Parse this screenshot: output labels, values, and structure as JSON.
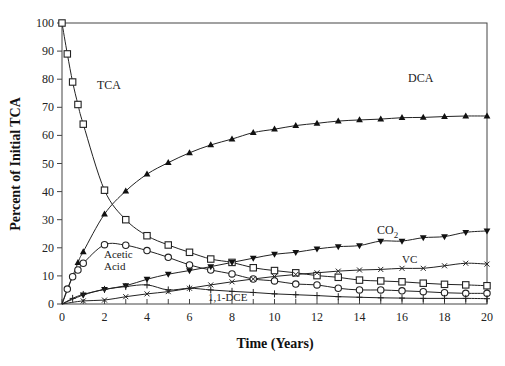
{
  "chart_data": {
    "type": "line",
    "title": "",
    "xlabel": "Time (Years)",
    "ylabel": "Percent of Initial TCA",
    "xlim": [
      0,
      20
    ],
    "ylim": [
      0,
      100
    ],
    "xticks": [
      0,
      2,
      4,
      6,
      8,
      10,
      12,
      14,
      16,
      18,
      20
    ],
    "yticks": [
      0,
      10,
      20,
      30,
      40,
      50,
      60,
      70,
      80,
      90,
      100
    ],
    "grid": false,
    "legend": "inline labels",
    "series": [
      {
        "name": "TCA",
        "marker": "open-square",
        "x": [
          0,
          0.25,
          0.5,
          0.75,
          1,
          2,
          3,
          4,
          5,
          6,
          7,
          8,
          9,
          10,
          11,
          12,
          13,
          14,
          15,
          16,
          17,
          18,
          19,
          20
        ],
        "y": [
          100,
          89,
          79,
          71,
          64,
          40.5,
          30,
          24.3,
          21,
          18.4,
          16,
          14.8,
          12.9,
          11.9,
          11.1,
          10.1,
          9.5,
          8.5,
          8.2,
          7.9,
          7.4,
          7.0,
          6.8,
          6.5
        ]
      },
      {
        "name": "DCA",
        "marker": "filled-triangle-up",
        "x": [
          0,
          0.75,
          1,
          2,
          3,
          4,
          5,
          6,
          7,
          8,
          9,
          10,
          11,
          12,
          13,
          14,
          15,
          16,
          17,
          18,
          19,
          20
        ],
        "y": [
          0,
          14.7,
          18.6,
          32,
          40.2,
          46.2,
          50.3,
          53.8,
          56.6,
          58.7,
          61,
          62.2,
          63.5,
          64.3,
          65.1,
          65.5,
          65.8,
          66.3,
          66.4,
          66.7,
          66.9,
          66.9
        ]
      },
      {
        "name": "Acetic Acid",
        "marker": "open-circle",
        "x": [
          0,
          0.25,
          0.5,
          0.75,
          1,
          2,
          3,
          4,
          5,
          6,
          7,
          8,
          9,
          10,
          11,
          12,
          13,
          14,
          15,
          16,
          17,
          18,
          19,
          20
        ],
        "y": [
          0,
          5.3,
          9.7,
          12.1,
          14.5,
          21.1,
          20.9,
          19,
          16.6,
          13.9,
          12.1,
          10.7,
          8.9,
          8.2,
          7.1,
          6.8,
          5.6,
          5.0,
          5.0,
          4.7,
          4.4,
          4.0,
          3.8,
          3.8
        ]
      },
      {
        "name": "CO2",
        "marker": "filled-triangle-down",
        "x": [
          0,
          1,
          2,
          3,
          4,
          5,
          6,
          7,
          8,
          9,
          10,
          11,
          12,
          13,
          14,
          15,
          16,
          17,
          18,
          19,
          20
        ],
        "y": [
          0,
          3.2,
          5.2,
          6.5,
          8.8,
          10.6,
          11.9,
          13.3,
          14.8,
          16.3,
          17.7,
          18.4,
          19.6,
          20.4,
          20.8,
          22.4,
          22.4,
          23.6,
          24,
          25.5,
          26
        ]
      },
      {
        "name": "VC",
        "marker": "x",
        "x": [
          0,
          1,
          2,
          3,
          4,
          5,
          6,
          7,
          8,
          9,
          10,
          11,
          12,
          13,
          14,
          15,
          16,
          17,
          18,
          19,
          20
        ],
        "y": [
          0,
          1.1,
          1.4,
          2.6,
          3.6,
          4.4,
          5.6,
          6.8,
          7.9,
          8.9,
          9.8,
          10.5,
          11.1,
          11.7,
          12.1,
          12.3,
          12.7,
          12.7,
          13.6,
          14.5,
          14.2
        ]
      },
      {
        "name": "1,1-DCE",
        "marker": "plus",
        "x": [
          0,
          0.5,
          1,
          2,
          3,
          4,
          5,
          6,
          7,
          8,
          9,
          10,
          11,
          12,
          13,
          14,
          15,
          16,
          17,
          18,
          19,
          20
        ],
        "y": [
          0,
          2.0,
          3.4,
          5.2,
          6.2,
          6.8,
          5.0,
          5.6,
          5.0,
          4.5,
          4.1,
          3.6,
          3.3,
          3.0,
          2.6,
          2.4,
          2.2,
          2.1,
          2.0,
          2.0,
          2.0,
          1.9
        ]
      }
    ],
    "annotations": [
      {
        "text": "TCA",
        "x": 1.6,
        "y": 73
      },
      {
        "text": "DCA",
        "x": 16.7,
        "y": 70
      },
      {
        "text": "Acetic",
        "x": 2.3,
        "y": 16
      },
      {
        "text": "Acid",
        "x": 2.3,
        "y": 11.5
      },
      {
        "text": "CO",
        "sub": "2",
        "x": 15.2,
        "y": 26
      },
      {
        "text": "VC",
        "x": 17.5,
        "y": 16
      },
      {
        "text": "1,1-DCE",
        "x": 7,
        "y": -1.8
      }
    ]
  },
  "labels": {
    "xlabel": "Time (Years)",
    "ylabel": "Percent of Initial TCA",
    "tca": "TCA",
    "dca": "DCA",
    "acetic1": "Acetic",
    "acetic2": "Acid",
    "co2": "CO",
    "co2_sub": "2",
    "vc": "VC",
    "dce": "1,1-DCE"
  }
}
